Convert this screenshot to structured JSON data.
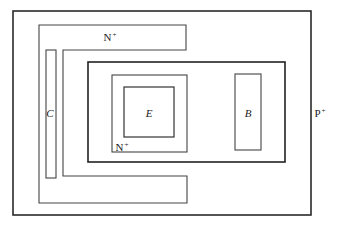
{
  "diagram": {
    "type": "transistor-layout-top-view",
    "stroke_color": "#333333",
    "background": "#ffffff",
    "regions": {
      "substrate": {
        "label": "P",
        "sup": "+"
      },
      "collector_region": {
        "label": "N",
        "sup": "+"
      },
      "emitter_region": {
        "label": "N",
        "sup": "+"
      },
      "collector_contact": {
        "label": "C"
      },
      "emitter_contact": {
        "label": "E"
      },
      "base_contact": {
        "label": "B"
      }
    }
  }
}
